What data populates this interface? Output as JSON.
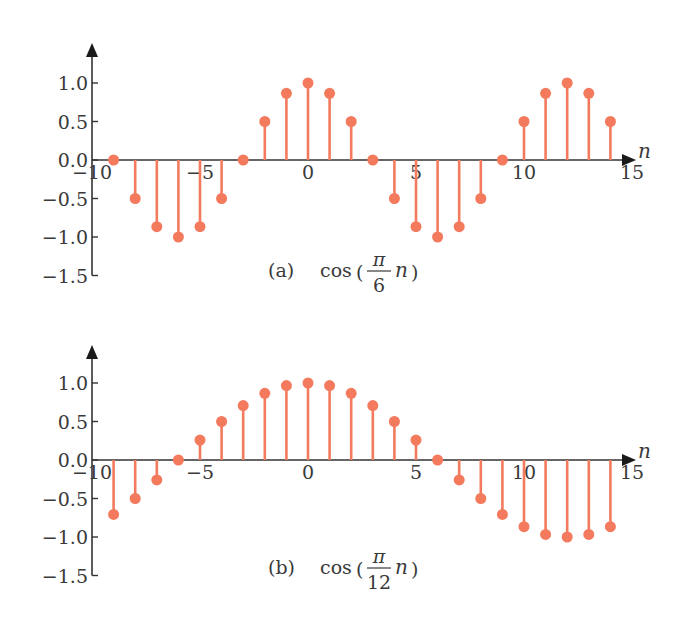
{
  "figure": {
    "panels": [
      {
        "id": "a",
        "caption_label": "(a)",
        "caption_func": "cos",
        "caption_num": "π",
        "caption_den": "6",
        "caption_var": "n"
      },
      {
        "id": "b",
        "caption_label": "(b)",
        "caption_func": "cos",
        "caption_num": "π",
        "caption_den": "12",
        "caption_var": "n"
      }
    ],
    "colors": {
      "stem": "#F47A5E",
      "axis": "#333333",
      "text": "#3a3a3a"
    }
  },
  "chart_data": [
    {
      "type": "stem",
      "title": "(a) cos(π/6 n)",
      "xlabel": "n",
      "ylabel": "",
      "xlim": [
        -10,
        15
      ],
      "ylim": [
        -1.5,
        1.0
      ],
      "xticks": [
        -10,
        -5,
        0,
        5,
        10,
        15
      ],
      "xtick_labels": [
        "−10",
        "−5",
        "0",
        "5",
        "10",
        "15"
      ],
      "yticks": [
        1.0,
        0.5,
        0.0,
        -0.5,
        -1.0,
        -1.5
      ],
      "ytick_labels": [
        "1.0",
        "0.5",
        "0.0",
        "−0.5",
        "−1.0",
        "−1.5"
      ],
      "grid": false,
      "x": [
        -9,
        -8,
        -7,
        -6,
        -5,
        -4,
        -3,
        -2,
        -1,
        0,
        1,
        2,
        3,
        4,
        5,
        6,
        7,
        8,
        9,
        10,
        11,
        12,
        13,
        14
      ],
      "values": [
        0.0,
        -0.5,
        -0.866,
        -1.0,
        -0.866,
        -0.5,
        0.0,
        0.5,
        0.866,
        1.0,
        0.866,
        0.5,
        0.0,
        -0.5,
        -0.866,
        -1.0,
        -0.866,
        -0.5,
        0.0,
        0.5,
        0.866,
        1.0,
        0.866,
        0.5
      ]
    },
    {
      "type": "stem",
      "title": "(b) cos(π/12 n)",
      "xlabel": "n",
      "ylabel": "",
      "xlim": [
        -10,
        15
      ],
      "ylim": [
        -1.5,
        1.0
      ],
      "xticks": [
        -10,
        -5,
        0,
        5,
        10,
        15
      ],
      "xtick_labels": [
        "−10",
        "−5",
        "0",
        "5",
        "10",
        "15"
      ],
      "yticks": [
        1.0,
        0.5,
        0.0,
        -0.5,
        -1.0,
        -1.5
      ],
      "ytick_labels": [
        "1.0",
        "0.5",
        "0.0",
        "−0.5",
        "−1.0",
        "−1.5"
      ],
      "grid": false,
      "x": [
        -9,
        -8,
        -7,
        -6,
        -5,
        -4,
        -3,
        -2,
        -1,
        0,
        1,
        2,
        3,
        4,
        5,
        6,
        7,
        8,
        9,
        10,
        11,
        12,
        13,
        14
      ],
      "values": [
        -0.707,
        -0.5,
        -0.259,
        0.0,
        0.259,
        0.5,
        0.707,
        0.866,
        0.966,
        1.0,
        0.966,
        0.866,
        0.707,
        0.5,
        0.259,
        0.0,
        -0.259,
        -0.5,
        -0.707,
        -0.866,
        -0.966,
        -1.0,
        -0.966,
        -0.866
      ]
    }
  ]
}
